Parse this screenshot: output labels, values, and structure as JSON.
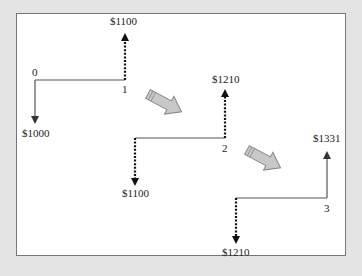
{
  "diagram": {
    "type": "cash-flow timeline (compound growth)",
    "periods": [
      {
        "index": "0",
        "outflow_label": "$1000"
      },
      {
        "index": "1",
        "inflow_label": "$1100"
      },
      {
        "index": "1",
        "outflow_label": "$1100"
      },
      {
        "index": "2",
        "inflow_label": "$1210"
      },
      {
        "index": "2",
        "outflow_label": "$1210"
      },
      {
        "index": "3",
        "inflow_label": "$1331"
      }
    ],
    "labels": {
      "t0": "0",
      "t1": "1",
      "t2": "2",
      "t3": "3",
      "down0": "$1000",
      "up1": "$1100",
      "down1": "$1100",
      "up2": "$1210",
      "down2": "$1210",
      "up3": "$1331"
    },
    "colors": {
      "background": "#e4e4e4",
      "panel": "#ffffff",
      "line": "#555555",
      "dotted": "#222222",
      "big_arrow_fill": "#c8c8c8",
      "big_arrow_stroke": "#888888"
    }
  }
}
